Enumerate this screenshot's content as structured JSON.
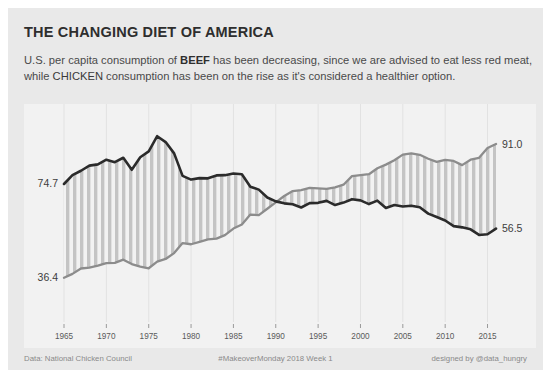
{
  "title": "THE CHANGING DIET OF AMERICA",
  "subtitle": {
    "part1": "U.S. per capita consumption of ",
    "kw_beef": "BEEF",
    "part2": " has been decreasing, since we are advised to eat less red meat, while ",
    "kw_chicken": "CHICKEN",
    "part3": " consumption has been on the rise as it's considered a healthier option."
  },
  "footer": {
    "source": "Data: National Chicken Council",
    "hashtag": "#MakeoverMonday 2018 Week 1",
    "credit": "designed by @data_hungry"
  },
  "colors": {
    "card_bg": "#e9e9e9",
    "plot_bg": "#f2f2f2",
    "beef_line": "#2b2b2b",
    "chicken_line": "#8c8c8c",
    "band_stripe": "#c2c2c2",
    "gridline": "#e2e2e2",
    "label": "#3d3d3d"
  },
  "chart_data": {
    "type": "line",
    "title": "THE CHANGING DIET OF AMERICA",
    "xlabel": "",
    "ylabel": "",
    "xlim": [
      1965,
      2016
    ],
    "ylim": [
      20,
      100
    ],
    "grid": true,
    "legend_position": "none",
    "xticks": [
      1965,
      1970,
      1975,
      1980,
      1985,
      1990,
      1995,
      2000,
      2005,
      2010,
      2015
    ],
    "annotations": [
      {
        "text": "74.7",
        "series": "Beef",
        "x": 1965,
        "y": 74.7,
        "position": "left"
      },
      {
        "text": "36.4",
        "series": "Chicken",
        "x": 1965,
        "y": 36.4,
        "position": "left"
      },
      {
        "text": "91.0",
        "series": "Chicken",
        "x": 2016,
        "y": 91.0,
        "position": "right"
      },
      {
        "text": "56.5",
        "series": "Beef",
        "x": 2016,
        "y": 56.5,
        "position": "right"
      }
    ],
    "x": [
      1965,
      1966,
      1967,
      1968,
      1969,
      1970,
      1971,
      1972,
      1973,
      1974,
      1975,
      1976,
      1977,
      1978,
      1979,
      1980,
      1981,
      1982,
      1983,
      1984,
      1985,
      1986,
      1987,
      1988,
      1989,
      1990,
      1991,
      1992,
      1993,
      1994,
      1995,
      1996,
      1997,
      1998,
      1999,
      2000,
      2001,
      2002,
      2003,
      2004,
      2005,
      2006,
      2007,
      2008,
      2009,
      2010,
      2011,
      2012,
      2013,
      2014,
      2015,
      2016
    ],
    "series": [
      {
        "name": "Beef",
        "color": "#2b2b2b",
        "values": [
          74.7,
          78.3,
          80.1,
          82.2,
          82.7,
          84.6,
          83.6,
          85.4,
          80.5,
          85.6,
          88.0,
          94.2,
          91.8,
          87.2,
          78.0,
          76.5,
          77.1,
          77.0,
          78.2,
          78.3,
          79.0,
          78.7,
          73.6,
          72.4,
          69.2,
          67.6,
          66.8,
          66.4,
          65.1,
          66.9,
          67.0,
          67.8,
          66.1,
          67.1,
          68.5,
          68.0,
          66.5,
          67.9,
          64.9,
          66.1,
          65.5,
          65.8,
          65.2,
          62.6,
          61.2,
          59.8,
          57.5,
          57.0,
          56.2,
          53.9,
          54.2,
          56.5
        ]
      },
      {
        "name": "Chicken",
        "color": "#8c8c8c",
        "values": [
          36.4,
          38.0,
          40.2,
          40.6,
          41.4,
          42.4,
          42.5,
          43.8,
          42.0,
          41.0,
          40.3,
          43.0,
          44.1,
          46.5,
          50.6,
          50.1,
          51.1,
          52.1,
          52.4,
          53.8,
          56.5,
          58.2,
          62.2,
          62.0,
          64.6,
          67.2,
          69.8,
          71.8,
          72.2,
          73.1,
          72.9,
          72.7,
          73.3,
          74.4,
          77.9,
          78.3,
          78.7,
          81.1,
          82.6,
          84.4,
          86.7,
          87.2,
          86.6,
          85.0,
          83.7,
          84.5,
          84.1,
          82.4,
          84.6,
          85.4,
          89.4,
          91.0
        ]
      }
    ]
  }
}
